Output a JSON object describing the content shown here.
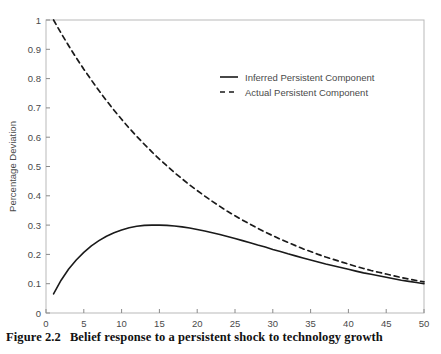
{
  "caption": {
    "number": "Figure 2.2",
    "text": "Belief response to a persistent shock to technology growth"
  },
  "chart_data": {
    "type": "line",
    "title": "",
    "xlabel": "",
    "ylabel": "Percentage Deviation",
    "xlim": [
      0,
      50
    ],
    "ylim": [
      0,
      1
    ],
    "xticks": [
      0,
      5,
      10,
      15,
      20,
      25,
      30,
      35,
      40,
      45,
      50
    ],
    "yticks": [
      0,
      0.1,
      0.2,
      0.3,
      0.4,
      0.5,
      0.6,
      0.7,
      0.8,
      0.9,
      1
    ],
    "xtick_labels": [
      "0",
      "5",
      "10",
      "15",
      "20",
      "25",
      "30",
      "35",
      "40",
      "45",
      "50"
    ],
    "ytick_labels": [
      "0",
      "0.1",
      "0.2",
      "0.3",
      "0.4",
      "0.5",
      "0.6",
      "0.7",
      "0.8",
      "0.9",
      "1"
    ],
    "grid": false,
    "legend_position": "upper-right-inside",
    "line_color": "#1a1a1a",
    "series": [
      {
        "name": "Inferred Persistent Component",
        "style": "solid",
        "x": [
          1,
          2,
          3,
          4,
          5,
          6,
          7,
          8,
          9,
          10,
          11,
          12,
          13,
          14,
          15,
          16,
          17,
          18,
          19,
          20,
          21,
          22,
          23,
          24,
          25,
          26,
          27,
          28,
          29,
          30,
          31,
          32,
          33,
          34,
          35,
          36,
          37,
          38,
          39,
          40,
          41,
          42,
          43,
          44,
          45,
          46,
          47,
          48,
          49,
          50
        ],
        "values": [
          0.065,
          0.112,
          0.15,
          0.181,
          0.207,
          0.229,
          0.247,
          0.262,
          0.274,
          0.283,
          0.291,
          0.296,
          0.299,
          0.3,
          0.3,
          0.299,
          0.297,
          0.294,
          0.29,
          0.285,
          0.28,
          0.274,
          0.268,
          0.261,
          0.254,
          0.247,
          0.24,
          0.232,
          0.225,
          0.217,
          0.21,
          0.202,
          0.195,
          0.188,
          0.181,
          0.174,
          0.167,
          0.161,
          0.155,
          0.149,
          0.143,
          0.137,
          0.132,
          0.127,
          0.122,
          0.117,
          0.112,
          0.108,
          0.104,
          0.1
        ]
      },
      {
        "name": "Actual Persistent Component",
        "style": "dashed",
        "x": [
          1,
          2,
          3,
          4,
          5,
          6,
          7,
          8,
          9,
          10,
          11,
          12,
          13,
          14,
          15,
          16,
          17,
          18,
          19,
          20,
          21,
          22,
          23,
          24,
          25,
          26,
          27,
          28,
          29,
          30,
          31,
          32,
          33,
          34,
          35,
          36,
          37,
          38,
          39,
          40,
          41,
          42,
          43,
          44,
          45,
          46,
          47,
          48,
          49,
          50
        ],
        "values": [
          1.0,
          0.955,
          0.912,
          0.871,
          0.832,
          0.795,
          0.759,
          0.725,
          0.692,
          0.661,
          0.631,
          0.603,
          0.576,
          0.55,
          0.525,
          0.502,
          0.479,
          0.458,
          0.437,
          0.418,
          0.399,
          0.381,
          0.364,
          0.347,
          0.332,
          0.317,
          0.303,
          0.289,
          0.276,
          0.264,
          0.252,
          0.241,
          0.23,
          0.219,
          0.21,
          0.2,
          0.191,
          0.183,
          0.175,
          0.167,
          0.159,
          0.152,
          0.145,
          0.139,
          0.133,
          0.127,
          0.121,
          0.116,
          0.111,
          0.106
        ]
      }
    ]
  },
  "legend": {
    "entries": [
      {
        "label": "Inferred Persistent Component",
        "style": "solid"
      },
      {
        "label": "Actual Persistent Component",
        "style": "dashed"
      }
    ]
  }
}
